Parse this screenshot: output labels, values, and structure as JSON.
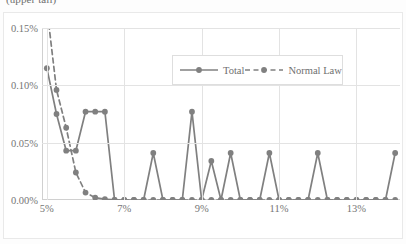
{
  "chart_data": {
    "type": "line",
    "title": "(upper tail)",
    "xlabel": "",
    "ylabel": "",
    "x": [
      5.0,
      5.25,
      5.5,
      5.75,
      6.0,
      6.25,
      6.5,
      6.75,
      7.0,
      7.25,
      7.5,
      7.75,
      8.0,
      8.25,
      8.5,
      8.75,
      9.0,
      9.25,
      9.5,
      9.75,
      10.0,
      10.25,
      10.5,
      10.75,
      11.0,
      11.25,
      11.5,
      11.75,
      12.0,
      12.25,
      12.5,
      12.75,
      13.0,
      13.25,
      13.5,
      13.75,
      14.0
    ],
    "x_tick_labels": [
      "5%",
      "7%",
      "9%",
      "11%",
      "13%"
    ],
    "x_tick_values": [
      5,
      7,
      9,
      11,
      13
    ],
    "y_tick_labels": [
      "0.00%",
      "0.05%",
      "0.10%",
      "0.15%"
    ],
    "y_tick_values": [
      0.0,
      0.05,
      0.1,
      0.15
    ],
    "ylim": [
      0,
      0.15
    ],
    "xlim": [
      4.875,
      14.125
    ],
    "grid": "both",
    "legend_position": "upper-center",
    "series": [
      {
        "name": "Total",
        "style": "solid",
        "marker": "circle",
        "color": "#808080",
        "values": [
          0.115,
          0.075,
          0.043,
          0.043,
          0.077,
          0.077,
          0.077,
          0.0,
          0.0,
          0.0,
          0.0,
          0.041,
          0.0,
          0.0,
          0.0,
          0.077,
          0.0,
          0.034,
          0.0,
          0.041,
          0.0,
          0.0,
          0.0,
          0.041,
          0.0,
          0.0,
          0.0,
          0.0,
          0.041,
          0.0,
          0.0,
          0.0,
          0.0,
          0.0,
          0.0,
          0.0,
          0.041
        ]
      },
      {
        "name": "Normal Law",
        "style": "dashed",
        "marker": "circle",
        "color": "#808080",
        "values": [
          0.168,
          0.096,
          0.063,
          0.024,
          0.0065,
          0.002,
          0.0008,
          0.0,
          0.0,
          0.0,
          0.0,
          0.0,
          0.0,
          0.0,
          0.0,
          0.0,
          0.0,
          0.0,
          0.0,
          0.0,
          0.0,
          0.0,
          0.0,
          0.0,
          0.0,
          0.0,
          0.0,
          0.0,
          0.0,
          0.0,
          0.0,
          0.0,
          0.0,
          0.0,
          0.0,
          0.0,
          0.0
        ]
      }
    ]
  },
  "legend": {
    "entries": [
      {
        "label": "Total"
      },
      {
        "label": "Normal Law"
      }
    ]
  },
  "colors": {
    "series": "#808080",
    "grid": "#e3e3e3",
    "axis": "#d0d0d0",
    "text": "#757575",
    "background": "#ffffff"
  }
}
